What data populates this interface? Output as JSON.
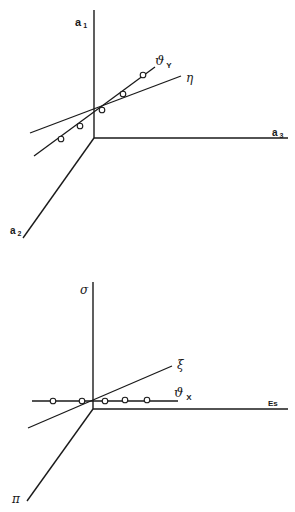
{
  "diagrams": [
    {
      "name": "top-3d-axes",
      "axes": [
        {
          "label": "a",
          "sub": "1",
          "direction": "vertical"
        },
        {
          "label": "a",
          "sub": "3",
          "direction": "horizontal"
        },
        {
          "label": "a",
          "sub": "2",
          "direction": "diagonal"
        }
      ],
      "lines": [
        {
          "label": "η",
          "kind": "plain"
        },
        {
          "label": "ϑ",
          "sub": "Y",
          "kind": "with-points",
          "points": 5
        }
      ]
    },
    {
      "name": "bottom-3d-axes",
      "axes": [
        {
          "label": "σ",
          "direction": "vertical"
        },
        {
          "label": "Es",
          "direction": "horizontal"
        },
        {
          "label": "π",
          "direction": "diagonal"
        }
      ],
      "lines": [
        {
          "label": "ξ",
          "kind": "plain"
        },
        {
          "label": "ϑ",
          "sub": "X",
          "kind": "with-points",
          "points": 5
        }
      ]
    }
  ]
}
